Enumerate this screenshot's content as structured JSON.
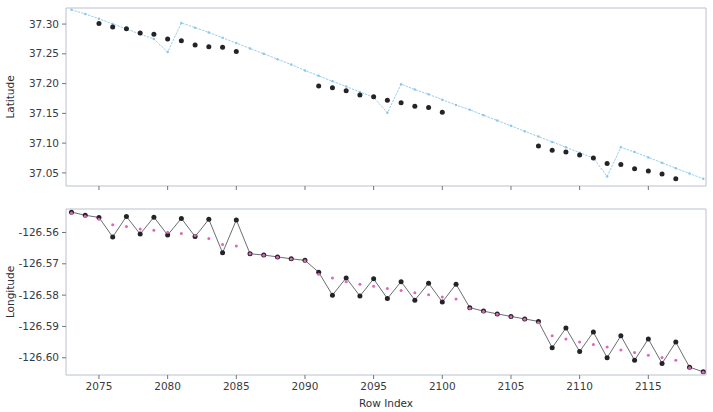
{
  "figure": {
    "width": 713,
    "height": 412,
    "background": "#ffffff",
    "panels": 2
  },
  "chart_data": [
    {
      "type": "scatter",
      "id": "latitude-panel",
      "title": "",
      "xlabel": "",
      "ylabel": "Latitude",
      "xlim": [
        2072.6,
        2119.2
      ],
      "ylim": [
        37.028,
        37.327
      ],
      "xticks": [
        2075,
        2080,
        2085,
        2090,
        2095,
        2100,
        2105,
        2110,
        2115
      ],
      "xticklabels": [
        "",
        "",
        "",
        "",
        "",
        "",
        "",
        "",
        ""
      ],
      "yticks": [
        37.05,
        37.1,
        37.15,
        37.2,
        37.25,
        37.3
      ],
      "yticklabels": [
        "37.05",
        "37.10",
        "37.15",
        "37.20",
        "37.25",
        "37.30"
      ],
      "grid": false,
      "legend": "none",
      "series": [
        {
          "name": "raw",
          "marker": "dot-line",
          "color": "#86c5ea",
          "linestyle": "dotted",
          "x": [
            2073,
            2074,
            2075,
            2076,
            2077,
            2078,
            2079,
            2080,
            2081,
            2082,
            2083,
            2084,
            2085,
            2086,
            2087,
            2088,
            2089,
            2090,
            2091,
            2092,
            2093,
            2094,
            2095,
            2096,
            2097,
            2098,
            2099,
            2100,
            2101,
            2102,
            2103,
            2104,
            2105,
            2106,
            2107,
            2108,
            2109,
            2110,
            2111,
            2112,
            2113,
            2114,
            2115,
            2116,
            2117,
            2118,
            2119
          ],
          "y": [
            37.324,
            37.317,
            37.309,
            37.3,
            37.292,
            37.283,
            37.275,
            37.253,
            37.302,
            37.294,
            37.286,
            37.277,
            37.268,
            37.259,
            37.25,
            37.241,
            37.232,
            37.222,
            37.213,
            37.204,
            37.195,
            37.186,
            37.177,
            37.151,
            37.199,
            37.19,
            37.182,
            37.173,
            37.164,
            37.156,
            37.147,
            37.138,
            37.129,
            37.12,
            37.111,
            37.102,
            37.093,
            37.084,
            37.075,
            37.044,
            37.093,
            37.085,
            37.076,
            37.067,
            37.058,
            37.049,
            37.04
          ]
        },
        {
          "name": "filtered",
          "marker": "o",
          "color": "#1b1b20",
          "linestyle": "none",
          "x": [
            2075,
            2076,
            2077,
            2078,
            2079,
            2080,
            2081,
            2082,
            2083,
            2084,
            2085,
            2091,
            2092,
            2093,
            2094,
            2095,
            2096,
            2097,
            2098,
            2099,
            2100,
            2107,
            2108,
            2109,
            2110,
            2111,
            2112,
            2113,
            2114,
            2115,
            2116,
            2117
          ],
          "y": [
            37.301,
            37.295,
            37.292,
            37.285,
            37.283,
            37.275,
            37.272,
            37.265,
            37.262,
            37.261,
            37.254,
            37.196,
            37.193,
            37.188,
            37.181,
            37.178,
            37.172,
            37.168,
            37.162,
            37.16,
            37.152,
            37.095,
            37.088,
            37.085,
            37.08,
            37.075,
            37.066,
            37.064,
            37.057,
            37.053,
            37.048,
            37.04
          ]
        }
      ]
    },
    {
      "type": "line",
      "id": "longitude-panel",
      "title": "",
      "xlabel": "Row Index",
      "ylabel": "Longitude",
      "xlim": [
        2072.6,
        2119.2
      ],
      "ylim": [
        -126.6055,
        -126.5525
      ],
      "xticks": [
        2075,
        2080,
        2085,
        2090,
        2095,
        2100,
        2105,
        2110,
        2115
      ],
      "xticklabels": [
        "2075",
        "2080",
        "2085",
        "2090",
        "2095",
        "2100",
        "2105",
        "2110",
        "2115"
      ],
      "yticks": [
        -126.6,
        -126.59,
        -126.58,
        -126.57,
        -126.56
      ],
      "yticklabels": [
        "-126.60",
        "-126.59",
        "-126.58",
        "-126.57",
        "-126.56"
      ],
      "grid": false,
      "legend": "none",
      "series": [
        {
          "name": "raw",
          "marker": "o",
          "color": "#1b1b20",
          "linecolor": "#55555f",
          "linestyle": "solid",
          "x": [
            2073,
            2074,
            2075,
            2076,
            2077,
            2078,
            2079,
            2080,
            2081,
            2082,
            2083,
            2084,
            2085,
            2086,
            2087,
            2088,
            2089,
            2090,
            2091,
            2092,
            2093,
            2094,
            2095,
            2096,
            2097,
            2098,
            2099,
            2100,
            2101,
            2102,
            2103,
            2104,
            2105,
            2106,
            2107,
            2108,
            2109,
            2110,
            2111,
            2112,
            2113,
            2114,
            2115,
            2116,
            2117,
            2118,
            2119
          ],
          "y": [
            -126.5535,
            -126.5545,
            -126.5552,
            -126.5614,
            -126.5549,
            -126.5605,
            -126.5551,
            -126.5608,
            -126.5555,
            -126.5613,
            -126.5558,
            -126.5665,
            -126.556,
            -126.5668,
            -126.5672,
            -126.5678,
            -126.5684,
            -126.5689,
            -126.5727,
            -126.58,
            -126.5745,
            -126.5803,
            -126.5748,
            -126.5811,
            -126.5757,
            -126.5816,
            -126.5762,
            -126.5822,
            -126.5765,
            -126.584,
            -126.5851,
            -126.586,
            -126.5868,
            -126.5876,
            -126.5884,
            -126.5968,
            -126.5905,
            -126.598,
            -126.5918,
            -126.6,
            -126.593,
            -126.6008,
            -126.594,
            -126.6018,
            -126.595,
            -126.603,
            -126.6045
          ]
        },
        {
          "name": "smoothed",
          "marker": ".",
          "color": "#e060b8",
          "linestyle": "none",
          "x": [
            2073,
            2074,
            2075,
            2076,
            2077,
            2078,
            2079,
            2080,
            2081,
            2082,
            2083,
            2084,
            2085,
            2086,
            2087,
            2088,
            2089,
            2090,
            2091,
            2092,
            2093,
            2094,
            2095,
            2096,
            2097,
            2098,
            2099,
            2100,
            2101,
            2102,
            2103,
            2104,
            2105,
            2106,
            2107,
            2108,
            2109,
            2110,
            2111,
            2112,
            2113,
            2114,
            2115,
            2116,
            2117,
            2118,
            2119
          ],
          "y": [
            -126.5538,
            -126.5548,
            -126.5558,
            -126.5575,
            -126.5581,
            -126.5589,
            -126.5593,
            -126.5599,
            -126.5603,
            -126.561,
            -126.5619,
            -126.5638,
            -126.5643,
            -126.5668,
            -126.5673,
            -126.5679,
            -126.5685,
            -126.569,
            -126.5733,
            -126.5745,
            -126.5757,
            -126.5765,
            -126.5772,
            -126.5779,
            -126.5785,
            -126.5792,
            -126.5799,
            -126.5806,
            -126.5812,
            -126.5842,
            -126.5852,
            -126.5861,
            -126.5869,
            -126.5877,
            -126.5888,
            -126.593,
            -126.594,
            -126.595,
            -126.5958,
            -126.5966,
            -126.5975,
            -126.5983,
            -126.5992,
            -126.5999,
            -126.6008,
            -126.6032,
            -126.6046
          ]
        }
      ]
    }
  ],
  "labels": {
    "latitude_axis_title": "Latitude",
    "longitude_axis_title": "Longitude",
    "row_index_axis_title": "Row Index"
  },
  "colors": {
    "raw_blue": "#86c5ea",
    "marker_black": "#1b1b20",
    "smoothed_pink": "#e060b8",
    "spine_grey": "#b9c0cf",
    "text_grey": "#3a3a42"
  }
}
